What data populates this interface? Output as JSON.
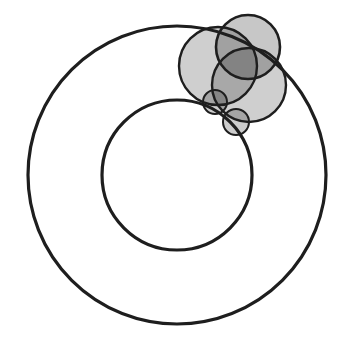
{
  "diagram": {
    "title": "",
    "width": 351,
    "height": 344,
    "background": "#ffffff",
    "stroke_color": "#1e1e1e",
    "circles": [
      {
        "id": "outer-circle",
        "cx": 177,
        "cy": 175,
        "r": 149,
        "fill": "none",
        "fill_opacity": 0,
        "stroke_width": 3.2
      },
      {
        "id": "inner-circle",
        "cx": 177,
        "cy": 175,
        "r": 75,
        "fill": "none",
        "fill_opacity": 0,
        "stroke_width": 3.2
      },
      {
        "id": "shaded-circle-a",
        "cx": 218,
        "cy": 66,
        "r": 39,
        "fill": "#000000",
        "fill_opacity": 0.19,
        "stroke_width": 2.4
      },
      {
        "id": "shaded-circle-b",
        "cx": 249,
        "cy": 85,
        "r": 37,
        "fill": "#000000",
        "fill_opacity": 0.19,
        "stroke_width": 2.4
      },
      {
        "id": "shaded-circle-c",
        "cx": 248,
        "cy": 47,
        "r": 32,
        "fill": "#000000",
        "fill_opacity": 0.22,
        "stroke_width": 2.6
      },
      {
        "id": "small-circle-d",
        "cx": 215,
        "cy": 102,
        "r": 12,
        "fill": "#000000",
        "fill_opacity": 0.2,
        "stroke_width": 2.0
      },
      {
        "id": "small-circle-e",
        "cx": 236,
        "cy": 122,
        "r": 13,
        "fill": "#000000",
        "fill_opacity": 0.2,
        "stroke_width": 2.0
      }
    ]
  }
}
